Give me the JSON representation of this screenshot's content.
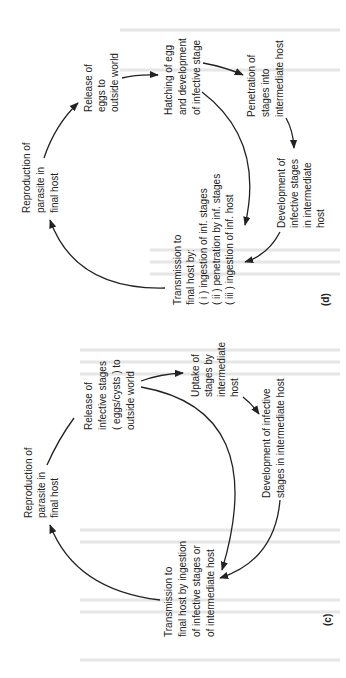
{
  "page": {
    "orientation": "rotated-90-ccw"
  },
  "diagram_d": {
    "caption": "(d)",
    "nodes": {
      "release": [
        "Release of",
        "eggs to",
        "outside world"
      ],
      "hatching": [
        "Hatching of egg",
        "and development",
        "of infective stage"
      ],
      "penetration": [
        "Penetration of",
        "stages into",
        "intermediate host"
      ],
      "development": [
        "Development of",
        "infective stages",
        "in intermediate",
        "host"
      ],
      "transmission": [
        "Transmission to",
        "final host by:",
        "( i ) ingestion of inf. stages",
        "( ii ) penetration by inf. stages",
        "( iii ) ingestion of inf. host"
      ],
      "reproduction": [
        "Reproduction of",
        "parasite in",
        "final host"
      ]
    }
  },
  "diagram_c": {
    "caption": "(c)",
    "nodes": {
      "release": [
        "Release of",
        "infective stages",
        "( eggs/cysts ) to",
        "outside world"
      ],
      "uptake": [
        "Uptake of",
        "stages by",
        "intermediate",
        "host"
      ],
      "development": [
        "Development of infective",
        "stages in intermediate host"
      ],
      "transmission": [
        "Transmission to",
        "final host by ingestion",
        "of infective stages or",
        "of intermediate host"
      ],
      "reproduction": [
        "Reproduction of",
        "parasite in",
        "final host"
      ]
    }
  }
}
